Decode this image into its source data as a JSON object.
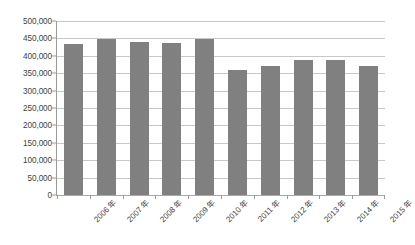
{
  "chart_data": {
    "type": "bar",
    "title": "",
    "subtitle": "",
    "xlabel": "",
    "ylabel": "",
    "categories": [
      "2006 年",
      "2007 年",
      "2008 年",
      "2009 年",
      "2010 年",
      "2011 年",
      "2012 年",
      "2013 年",
      "2014 年",
      "2015 年"
    ],
    "values": [
      434000,
      448000,
      440000,
      438000,
      447000,
      358000,
      371000,
      387000,
      387000,
      371000
    ],
    "ylim": [
      0,
      500000
    ],
    "ytick_values": [
      0,
      50000,
      100000,
      150000,
      200000,
      250000,
      300000,
      350000,
      400000,
      450000,
      500000
    ],
    "ytick_labels": [
      "0",
      "50,000",
      "100,000",
      "150,000",
      "200,000",
      "250,000",
      "300,000",
      "350,000",
      "400,000",
      "450,000",
      "500,000"
    ],
    "grid": true,
    "grid_axis": "y",
    "legend": false,
    "legend_position": "none",
    "bar_color": "#808080",
    "gridline_color": "#c8c8c8",
    "axis_color": "#9a9a9a",
    "background_color": "#ffffff",
    "xtick_rotation": -45
  }
}
